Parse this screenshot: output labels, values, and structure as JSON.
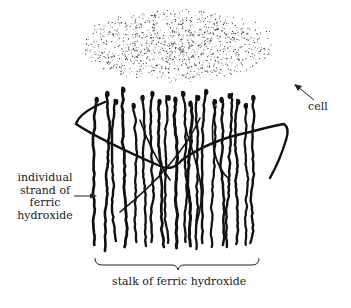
{
  "diagram": {
    "title": "",
    "colors": {
      "ink": "#111111",
      "background": "#ffffff",
      "stipple": "#333333"
    },
    "labels": {
      "cell": "cell",
      "strand": [
        "individual",
        "strand of",
        "ferric",
        "hydroxide"
      ],
      "stalk": "stalk of ferric hydroxide"
    },
    "nodes": [
      {
        "id": "cell",
        "shape": "stippled-ellipse",
        "label": "cell"
      },
      {
        "id": "strand",
        "shape": "wavy-line",
        "label": "individual strand of ferric hydroxide"
      },
      {
        "id": "stalk",
        "shape": "bundle-of-strands",
        "label": "stalk of ferric hydroxide"
      }
    ],
    "annotations": [
      {
        "type": "arrow",
        "target": "cell",
        "label": "cell"
      },
      {
        "type": "arrow",
        "target": "strand",
        "label": "individual strand of ferric hydroxide"
      },
      {
        "type": "brace",
        "target": "stalk",
        "label": "stalk of ferric hydroxide"
      }
    ]
  }
}
